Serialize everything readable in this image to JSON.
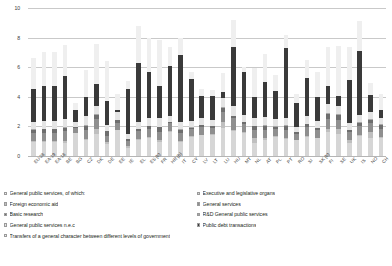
{
  "chart_data": {
    "type": "bar",
    "stacked": true,
    "title": "",
    "subtitle": "",
    "xlabel": "",
    "ylabel": "",
    "ylim": [
      0,
      10
    ],
    "yticks": [
      "0",
      "2",
      "4",
      "6",
      "8",
      "10"
    ],
    "grid": true,
    "legend_position": "bottom",
    "categories": [
      "EU-28",
      "EA-19",
      "EA-18",
      "BE",
      "BG",
      "CZ",
      "DK",
      "DE",
      "EE",
      "IE",
      "EL",
      "ES (b)",
      "FR",
      "HR (b)",
      "IT",
      "CY",
      "LV",
      "LT",
      "LU",
      "HU",
      "MT",
      "NL",
      "AT",
      "PL",
      "PT",
      "RO",
      "SI",
      "SK (b)",
      "FI",
      "SE",
      "UK",
      "IS",
      "NO",
      "CH"
    ],
    "series": [
      {
        "name": "Executive and legislative organs",
        "color": "#d6d6d6",
        "values": [
          0.95,
          0.95,
          0.95,
          0.9,
          1.55,
          1.1,
          1.5,
          0.8,
          1.75,
          0.55,
          1.1,
          1.2,
          0.95,
          1.65,
          0.95,
          1.3,
          1.4,
          1.45,
          1.9,
          1.7,
          1.55,
          0.9,
          1.1,
          1.3,
          1.15,
          1.05,
          1.3,
          1.2,
          1.6,
          1.5,
          0.9,
          1.35,
          1.25,
          1.2
        ]
      },
      {
        "name": "Foreign economic aid",
        "color": "#bfbfbf",
        "values": [
          0.06,
          0.06,
          0.06,
          0.1,
          0.02,
          0.04,
          0.3,
          0.12,
          0.02,
          0.12,
          0.02,
          0.08,
          0.1,
          0.02,
          0.06,
          0.02,
          0.02,
          0.02,
          0.4,
          0.04,
          0.04,
          0.3,
          0.1,
          0.04,
          0.08,
          0.02,
          0.04,
          0.04,
          0.22,
          0.3,
          0.2,
          0.1,
          0.4,
          0.1
        ]
      },
      {
        "name": "General services",
        "color": "#8f8f8f",
        "values": [
          0.55,
          0.55,
          0.55,
          0.7,
          0.35,
          0.65,
          0.7,
          0.45,
          0.45,
          0.35,
          0.6,
          0.55,
          0.6,
          0.55,
          0.55,
          0.5,
          0.55,
          0.45,
          0.7,
          0.8,
          0.6,
          0.55,
          0.55,
          0.5,
          0.55,
          0.45,
          0.6,
          0.55,
          0.7,
          0.65,
          0.5,
          0.6,
          0.55,
          0.5
        ]
      },
      {
        "name": "Basic research",
        "color": "#6e6e6e",
        "values": [
          0.22,
          0.24,
          0.24,
          0.2,
          0.05,
          0.25,
          0.25,
          0.3,
          0.2,
          0.1,
          0.1,
          0.18,
          0.28,
          0.05,
          0.2,
          0.1,
          0.1,
          0.1,
          0.25,
          0.15,
          0.1,
          0.25,
          0.3,
          0.15,
          0.25,
          0.08,
          0.2,
          0.1,
          0.35,
          0.3,
          0.15,
          0.2,
          0.25,
          0.3
        ]
      },
      {
        "name": "R&D General public services",
        "color": "#a8a8a8",
        "values": [
          0.05,
          0.05,
          0.05,
          0.05,
          0.02,
          0.06,
          0.06,
          0.05,
          0.03,
          0.03,
          0.02,
          0.05,
          0.06,
          0.02,
          0.05,
          0.03,
          0.03,
          0.03,
          0.06,
          0.04,
          0.03,
          0.06,
          0.06,
          0.04,
          0.05,
          0.02,
          0.05,
          0.03,
          0.07,
          0.06,
          0.04,
          0.05,
          0.06,
          0.05
        ]
      },
      {
        "name": "General public services n.e.c",
        "color": "#e4e4e4",
        "values": [
          0.5,
          0.5,
          0.5,
          0.55,
          0.3,
          0.6,
          0.55,
          0.4,
          0.5,
          0.35,
          0.45,
          0.5,
          0.55,
          0.4,
          0.5,
          0.45,
          0.45,
          0.4,
          0.6,
          0.65,
          0.45,
          0.5,
          0.5,
          0.45,
          0.5,
          0.35,
          0.5,
          0.45,
          0.6,
          0.55,
          0.45,
          0.5,
          0.5,
          0.45
        ]
      },
      {
        "name": "Public debt transactions",
        "color": "#3a3a3a",
        "values": [
          2.2,
          2.4,
          2.4,
          2.9,
          0.8,
          1.3,
          1.5,
          1.6,
          0.15,
          3.0,
          4.0,
          3.1,
          2.2,
          3.4,
          4.5,
          2.8,
          1.5,
          1.6,
          0.4,
          4.0,
          2.9,
          1.4,
          2.4,
          1.9,
          4.7,
          1.6,
          2.6,
          1.6,
          1.2,
          0.7,
          2.9,
          4.3,
          1.1,
          0.5
        ]
      },
      {
        "name": "Transfers of a general character between different levels of government",
        "color": "#efefef",
        "values": [
          2.1,
          2.25,
          2.25,
          2.1,
          0.5,
          1.8,
          2.7,
          2.7,
          1.1,
          0.55,
          2.5,
          2.3,
          3.1,
          1.3,
          1.2,
          0.5,
          0.5,
          0.4,
          1.3,
          1.8,
          0.35,
          2.0,
          1.9,
          1.1,
          0.9,
          0.6,
          1.2,
          1.7,
          2.6,
          3.4,
          2.2,
          2.0,
          0.8,
          1.1
        ]
      }
    ]
  },
  "legend": {
    "left_column": [
      {
        "label": "General public services, of which:",
        "swatch": "#efefef"
      },
      {
        "label": "Foreign economic aid",
        "swatch": "#bfbfbf"
      },
      {
        "label": "Basic research",
        "swatch": "#6e6e6e"
      },
      {
        "label": "General public services n.e.c",
        "swatch": "#e4e4e4"
      },
      {
        "label": "Transfers of a general character between different levels of government",
        "swatch": "#efefef"
      }
    ],
    "right_column": [
      {
        "label": "Executive and legislative organs",
        "swatch": "#d6d6d6"
      },
      {
        "label": "General services",
        "swatch": "#8f8f8f"
      },
      {
        "label": "R&D General public services",
        "swatch": "#a8a8a8"
      },
      {
        "label": "Public debt transactions",
        "swatch": "#3a3a3a"
      }
    ]
  },
  "colors": {
    "grid": "#c9c9c9",
    "axis": "#b5b5b5",
    "text": "#231f20"
  }
}
